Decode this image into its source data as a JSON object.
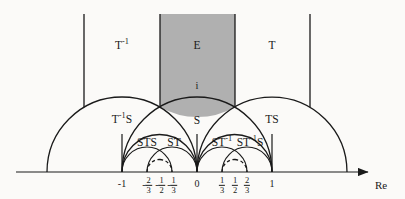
{
  "figure": {
    "background_color": "#fbfaf8",
    "shaded_fill": "#b0b0b0",
    "line_color": "#1a1a1a"
  },
  "axis": {
    "name": "real-axis",
    "label": "Re",
    "y_pixel": 172,
    "arrow": "right"
  },
  "ticks": [
    {
      "id": "tick-neg-1",
      "value": -1,
      "label_type": "integer",
      "text": "-1",
      "x_pixel": 122
    },
    {
      "id": "tick-neg-2-3",
      "value": -0.6667,
      "label_type": "fraction",
      "sign": "-",
      "num": "2",
      "den": "3",
      "x_pixel": 147
    },
    {
      "id": "tick-neg-1-2",
      "value": -0.5,
      "label_type": "fraction",
      "sign": "-",
      "num": "1",
      "den": "2",
      "x_pixel": 160
    },
    {
      "id": "tick-neg-1-3",
      "value": -0.3333,
      "label_type": "fraction",
      "sign": "-",
      "num": "1",
      "den": "3",
      "x_pixel": 172
    },
    {
      "id": "tick-zero",
      "value": 0,
      "label_type": "integer",
      "text": "0",
      "x_pixel": 197
    },
    {
      "id": "tick-pos-1-3",
      "value": 0.3333,
      "label_type": "fraction",
      "sign": "",
      "num": "1",
      "den": "3",
      "x_pixel": 222
    },
    {
      "id": "tick-pos-1-2",
      "value": 0.5,
      "label_type": "fraction",
      "sign": "",
      "num": "1",
      "den": "2",
      "x_pixel": 235
    },
    {
      "id": "tick-pos-2-3",
      "value": 0.6667,
      "label_type": "fraction",
      "sign": "",
      "num": "2",
      "den": "3",
      "x_pixel": 247
    },
    {
      "id": "tick-pos-1",
      "value": 1,
      "label_type": "integer",
      "text": "1",
      "x_pixel": 272
    }
  ],
  "points": [
    {
      "id": "point-i",
      "label": "i",
      "x_pixel": 197,
      "y_pixel": 86
    }
  ],
  "regions": [
    {
      "id": "region-T-inv",
      "base": "T",
      "exponent": "-1",
      "suffix": "",
      "x_pixel": 122,
      "y_pixel": 46,
      "shaded": false
    },
    {
      "id": "region-E",
      "base": "E",
      "exponent": "",
      "suffix": "",
      "x_pixel": 197,
      "y_pixel": 46,
      "shaded": true
    },
    {
      "id": "region-T",
      "base": "T",
      "exponent": "",
      "suffix": "",
      "x_pixel": 272,
      "y_pixel": 46,
      "shaded": false
    },
    {
      "id": "region-T-inv-S",
      "base": "T",
      "exponent": "-1",
      "suffix": "S",
      "x_pixel": 122,
      "y_pixel": 120,
      "shaded": false
    },
    {
      "id": "region-S",
      "base": "S",
      "exponent": "",
      "suffix": "",
      "x_pixel": 197,
      "y_pixel": 121,
      "shaded": false
    },
    {
      "id": "region-TS",
      "base": "TS",
      "exponent": "",
      "suffix": "",
      "x_pixel": 272,
      "y_pixel": 120,
      "shaded": false
    },
    {
      "id": "region-STS",
      "base": "STS",
      "exponent": "",
      "suffix": "",
      "x_pixel": 147,
      "y_pixel": 143,
      "shaded": false
    },
    {
      "id": "region-ST",
      "base": "ST",
      "exponent": "",
      "suffix": "",
      "x_pixel": 174,
      "y_pixel": 143,
      "shaded": false
    },
    {
      "id": "region-ST-inv",
      "base": "ST",
      "exponent": "-1",
      "suffix": "",
      "x_pixel": 222,
      "y_pixel": 143,
      "shaded": false
    },
    {
      "id": "region-ST-inv-S",
      "base": "ST",
      "exponent": "-1",
      "suffix": "S",
      "x_pixel": 250,
      "y_pixel": 143,
      "shaded": false
    }
  ],
  "geometry": {
    "unit_px": 75,
    "origin_x": 197,
    "axis_y": 172,
    "shaded_left_x": 160,
    "shaded_right_x": 235,
    "shaded_top_y": 14,
    "vertical_left_x": 84,
    "vertical_right_x": 310,
    "arc_join_y": 107,
    "cusps": [
      -1,
      0,
      1
    ],
    "dashed_arc_centers": [
      -0.5,
      0.5
    ]
  }
}
